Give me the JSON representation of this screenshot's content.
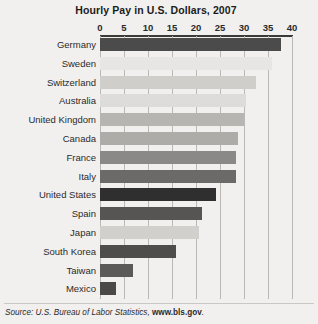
{
  "chart_data": {
    "type": "bar",
    "orientation": "horizontal",
    "title": "Hourly Pay in U.S. Dollars, 2007",
    "xlabel": "",
    "ylabel": "",
    "xlim": [
      0,
      40
    ],
    "xticks": [
      0,
      5,
      10,
      15,
      20,
      25,
      30,
      35,
      40
    ],
    "xtick_labels": [
      "0",
      "5",
      "10",
      "15",
      "20",
      "25",
      "30",
      "35",
      "40"
    ],
    "grid": true,
    "legend": "none",
    "categories": [
      "Germany",
      "Sweden",
      "Switzerland",
      "Australia",
      "United Kingdom",
      "Canada",
      "France",
      "Italy",
      "United States",
      "Spain",
      "Japan",
      "South Korea",
      "Taiwan",
      "Mexico"
    ],
    "values": [
      37.7,
      35.8,
      32.5,
      30.5,
      30.0,
      28.7,
      28.4,
      28.4,
      24.2,
      21.3,
      20.6,
      15.8,
      6.9,
      3.3
    ],
    "bar_colors": [
      "#4b4b4b",
      "#e7e6e4",
      "#cfcecb",
      "#dddcda",
      "#b6b5b2",
      "#adaca9",
      "#8a8987",
      "#6b6a68",
      "#2f2f2f",
      "#565554",
      "#d1d0cd",
      "#4e4d4c",
      "#5b5a58",
      "#4a4948"
    ]
  },
  "footer": {
    "source_prefix": "Source: U.S. Bureau of Labor Statistics, ",
    "source_url": "www.bls.gov",
    "source_suffix": "."
  }
}
